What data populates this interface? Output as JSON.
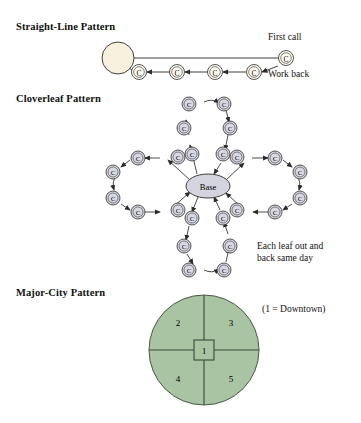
{
  "figure": {
    "sections": [
      {
        "id": "straight-line",
        "heading": "Straight-Line Pattern"
      },
      {
        "id": "cloverleaf",
        "heading": "Cloverleaf Pattern"
      },
      {
        "id": "major-city",
        "heading": "Major-City Pattern"
      }
    ]
  },
  "straight_line": {
    "heading": "Straight-Line Pattern",
    "first_call_label": "First call",
    "work_back_label": "Work back",
    "base_node_label": "",
    "node_label": "C",
    "node_count": 4,
    "base_fill": "#F6F0DC",
    "node_fill": "#FFFDF2"
  },
  "cloverleaf": {
    "heading": "Cloverleaf Pattern",
    "base_label": "Base",
    "node_label": "C",
    "note": "Each leaf out and back same day",
    "note_line1": "Each leaf out and",
    "note_line2": "back same day",
    "leaf_count": 4,
    "nodes_per_leaf": 6,
    "base_fill": "#D4D4DE",
    "node_fill": "#D8D8E2"
  },
  "major_city": {
    "heading": "Major-City Pattern",
    "legend": "(1 = Downtown)",
    "circle_fill": "#A8C4A2",
    "stroke": "#3B4A38",
    "zones": [
      {
        "id": "downtown",
        "label": "1"
      },
      {
        "id": "northwest",
        "label": "2"
      },
      {
        "id": "northeast",
        "label": "3"
      },
      {
        "id": "southwest",
        "label": "4"
      },
      {
        "id": "southeast",
        "label": "5"
      }
    ],
    "center_label": "1",
    "quadrant_labels": [
      "2",
      "3",
      "4",
      "5"
    ]
  },
  "colors": {
    "line": "#2b2b2b",
    "text": "#111111",
    "green": "#A8C4A2",
    "cream": "#F6F0DC",
    "grey_node": "#D8D8E2"
  }
}
